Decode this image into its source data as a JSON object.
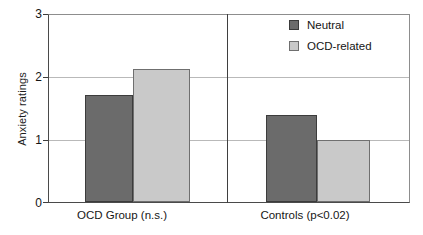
{
  "chart_data": {
    "type": "bar",
    "title": "",
    "subtitle": "",
    "xlabel": "",
    "ylabel": "Anxiety ratings",
    "ylim": [
      0,
      3
    ],
    "yticks": [
      "0",
      "1",
      "2",
      "3"
    ],
    "ytick_values": [
      0,
      1,
      2,
      3
    ],
    "grid": true,
    "grid_axis": "y",
    "legend_position": "top-right",
    "categories": [
      "OCD Group (n.s.)",
      "Controls (p<0.02)"
    ],
    "series": [
      {
        "name": "Neutral",
        "color": "#6b6b6b",
        "values": [
          1.72,
          1.39
        ]
      },
      {
        "name": "OCD-related",
        "color": "#c9c9c9",
        "values": [
          2.13,
          1.0
        ]
      }
    ],
    "annotations": [],
    "group_divider": true
  },
  "legend": {
    "items": [
      {
        "label": "Neutral",
        "swatch": "neutral-swatch"
      },
      {
        "label": "OCD-related",
        "swatch": "ocd-related-swatch"
      }
    ]
  },
  "axes": {
    "y_title": "Anxiety ratings",
    "y_tick_labels": [
      "3",
      "2",
      "1",
      "0"
    ],
    "x_tick_labels": [
      "OCD Group (n.s.)",
      "Controls (p<0.02)"
    ]
  },
  "colors": {
    "neutral": "#6b6b6b",
    "ocd_related": "#c9c9c9",
    "axis": "#3d3d3d",
    "grid": "#b9b9b9",
    "background": "#ffffff"
  }
}
